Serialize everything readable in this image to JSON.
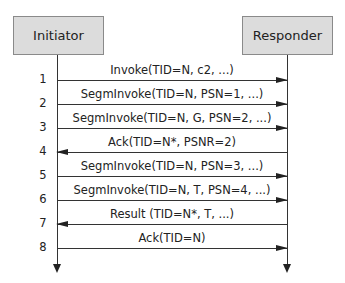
{
  "diagram": {
    "type": "sequence",
    "participants": [
      {
        "name": "Initiator"
      },
      {
        "name": "Responder"
      }
    ],
    "messages": [
      {
        "step": "1",
        "label": "Invoke(TID=N, c2, ...)",
        "from": "Initiator",
        "to": "Responder"
      },
      {
        "step": "2",
        "label": "SegmInvoke(TID=N, PSN=1, ...)",
        "from": "Initiator",
        "to": "Responder"
      },
      {
        "step": "3",
        "label": "SegmInvoke(TID=N, G, PSN=2, ...)",
        "from": "Initiator",
        "to": "Responder"
      },
      {
        "step": "4",
        "label": "Ack(TID=N*, PSNR=2)",
        "from": "Responder",
        "to": "Initiator"
      },
      {
        "step": "5",
        "label": "SegmInvoke(TID=N, PSN=3, ...)",
        "from": "Initiator",
        "to": "Responder"
      },
      {
        "step": "6",
        "label": "SegmInvoke(TID=N, T, PSN=4, ...)",
        "from": "Initiator",
        "to": "Responder"
      },
      {
        "step": "7",
        "label": "Result (TID=N*, T, ...)",
        "from": "Responder",
        "to": "Initiator"
      },
      {
        "step": "8",
        "label": "Ack(TID=N)",
        "from": "Initiator",
        "to": "Responder"
      }
    ],
    "colors": {
      "actor_fill": "#dcdcdc",
      "actor_border": "#8a8a8a",
      "line": "#333333"
    }
  }
}
